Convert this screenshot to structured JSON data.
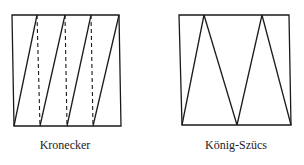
{
  "figures": [
    {
      "id": "kronecker",
      "caption": "Kronecker",
      "caption_pos": {
        "x": 65,
        "y": 138
      },
      "box": {
        "tl": [
          12,
          15
        ],
        "tr": [
          119,
          15
        ],
        "br": [
          121,
          126
        ],
        "bl": [
          14,
          126
        ]
      },
      "solid_lines": [
        [
          [
            14,
            126
          ],
          [
            37,
            15
          ]
        ],
        [
          [
            40,
            126
          ],
          [
            65,
            15
          ]
        ],
        [
          [
            67,
            126
          ],
          [
            91,
            15
          ]
        ],
        [
          [
            93,
            126
          ],
          [
            119,
            15
          ]
        ]
      ],
      "dashed_lines": [
        [
          [
            37,
            15
          ],
          [
            40,
            126
          ]
        ],
        [
          [
            65,
            15
          ],
          [
            67,
            126
          ]
        ],
        [
          [
            91,
            15
          ],
          [
            93,
            126
          ]
        ]
      ]
    },
    {
      "id": "konig-szucs",
      "caption": "König-Szücs",
      "caption_pos": {
        "x": 236,
        "y": 138
      },
      "box": {
        "tl": [
          179,
          15
        ],
        "tr": [
          289,
          15
        ],
        "br": [
          291,
          125
        ],
        "bl": [
          182,
          125
        ]
      },
      "solid_lines": [
        [
          [
            182,
            125
          ],
          [
            204,
            15
          ]
        ],
        [
          [
            204,
            15
          ],
          [
            237,
            125
          ]
        ],
        [
          [
            237,
            125
          ],
          [
            262,
            15
          ]
        ],
        [
          [
            262,
            15
          ],
          [
            291,
            125
          ]
        ]
      ],
      "dashed_lines": []
    }
  ],
  "style": {
    "stroke": "#1a1a1a",
    "stroke_width": 1.3
  }
}
